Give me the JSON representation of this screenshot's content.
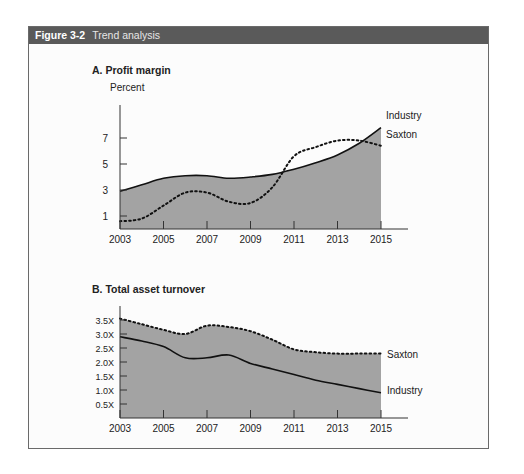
{
  "figure": {
    "number": "Figure 3-2",
    "title": "Trend analysis"
  },
  "colors": {
    "header_bg": "#5a5a5a",
    "area_fill": "#a3a3a3",
    "line": "#111111"
  },
  "chart_data": [
    {
      "type": "area",
      "title": "A. Profit margin",
      "ylabel": "Percent",
      "xlabel": "",
      "x_ticks": [
        "2003",
        "2005",
        "2007",
        "2009",
        "2011",
        "2013",
        "2015"
      ],
      "y_ticks": [
        "1",
        "3",
        "5",
        "7"
      ],
      "xlim": [
        2003,
        2015
      ],
      "ylim": [
        0,
        8
      ],
      "grid": false,
      "legend_position": "inline-right",
      "series": [
        {
          "name": "Industry",
          "style": "solid",
          "filled": true,
          "x": [
            2003,
            2004,
            2005,
            2006,
            2007,
            2008,
            2009,
            2010,
            2011,
            2012,
            2013,
            2014,
            2015
          ],
          "values": [
            2.9,
            3.4,
            3.9,
            4.1,
            4.1,
            3.9,
            4.0,
            4.2,
            4.6,
            5.1,
            5.7,
            6.6,
            7.8
          ]
        },
        {
          "name": "Saxton",
          "style": "dotted",
          "filled": false,
          "x": [
            2003,
            2004,
            2005,
            2006,
            2007,
            2008,
            2009,
            2010,
            2011,
            2012,
            2013,
            2014,
            2015
          ],
          "values": [
            0.6,
            0.8,
            1.8,
            2.8,
            2.8,
            2.1,
            2.0,
            3.2,
            5.6,
            6.3,
            6.8,
            6.8,
            6.4
          ]
        }
      ]
    },
    {
      "type": "area",
      "title": "B. Total asset turnover",
      "ylabel": "",
      "xlabel": "",
      "x_ticks": [
        "2003",
        "2005",
        "2007",
        "2009",
        "2011",
        "2013",
        "2015"
      ],
      "y_ticks": [
        "0.5X",
        "1.0X",
        "1.5X",
        "2.0X",
        "2.5X",
        "3.0X",
        "3.5X"
      ],
      "xlim": [
        2003,
        2015
      ],
      "ylim": [
        0,
        3.7
      ],
      "grid": false,
      "legend_position": "inline-right",
      "series": [
        {
          "name": "Saxton",
          "style": "dotted",
          "filled": true,
          "x": [
            2003,
            2004,
            2005,
            2006,
            2007,
            2008,
            2009,
            2010,
            2011,
            2012,
            2013,
            2014,
            2015
          ],
          "values": [
            3.55,
            3.35,
            3.15,
            3.0,
            3.3,
            3.25,
            3.1,
            2.8,
            2.45,
            2.35,
            2.3,
            2.3,
            2.3
          ]
        },
        {
          "name": "Industry",
          "style": "solid",
          "filled": false,
          "x": [
            2003,
            2004,
            2005,
            2006,
            2007,
            2008,
            2009,
            2010,
            2011,
            2012,
            2013,
            2014,
            2015
          ],
          "values": [
            2.9,
            2.75,
            2.55,
            2.15,
            2.15,
            2.25,
            1.95,
            1.75,
            1.55,
            1.35,
            1.2,
            1.05,
            0.9
          ]
        }
      ]
    }
  ]
}
